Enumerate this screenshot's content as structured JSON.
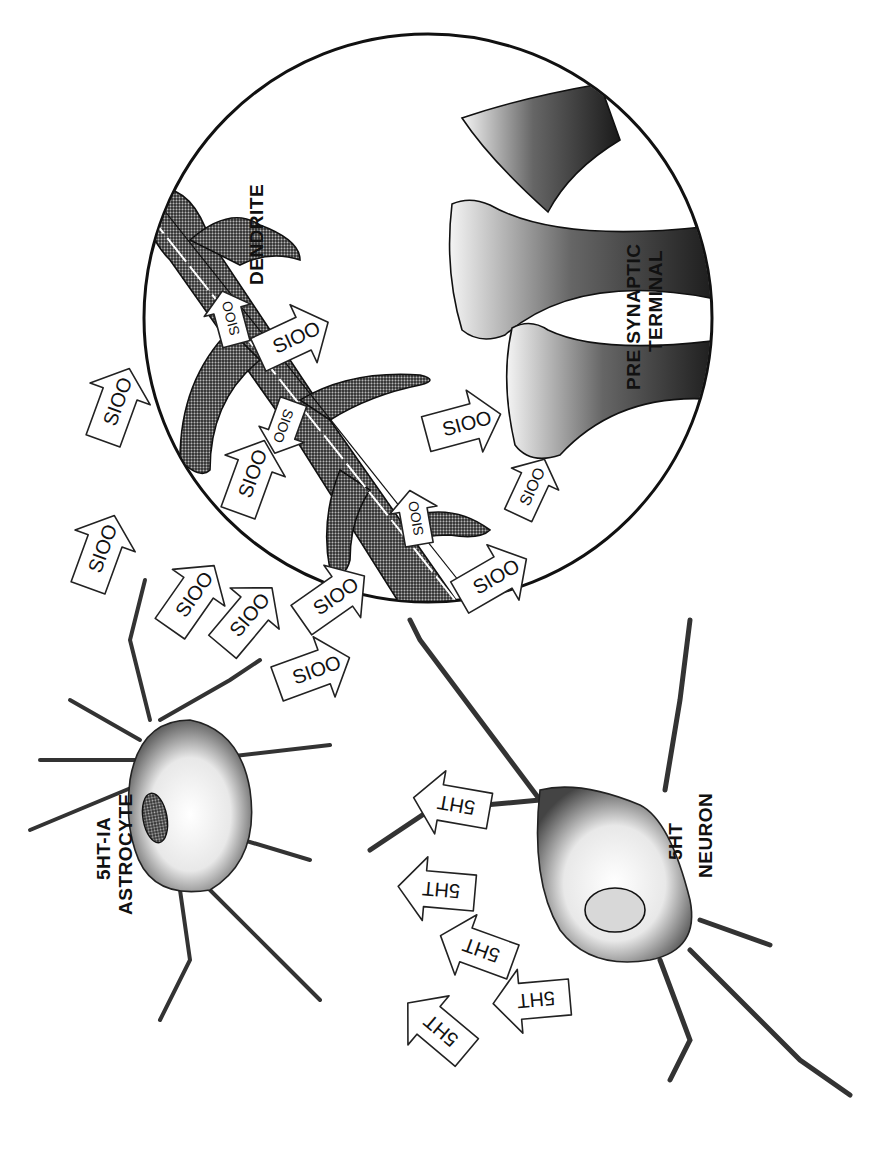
{
  "figure": {
    "orientation": "rotated 90 degrees clockwise",
    "colors": {
      "ink": "#111111",
      "background": "#ffffff"
    }
  },
  "labels": {
    "dendrite": "DENDRITE",
    "presynaptic_line1": "PRE SYNAPTIC",
    "presynaptic_line2": "TERMINAL",
    "astrocyte_line1": "5HT-IA",
    "astrocyte_line2": "ASTROCYTE",
    "neuron_line1": "5HT",
    "neuron_line2": "NEURON"
  },
  "s100_arrows": [
    {
      "text": "SIOO"
    },
    {
      "text": "SIOO"
    },
    {
      "text": "SIOO"
    },
    {
      "text": "SIOO"
    },
    {
      "text": "SIOO"
    },
    {
      "text": "SIOO"
    },
    {
      "text": "SIOO"
    },
    {
      "text": "SIOO"
    },
    {
      "text": "SIOO"
    },
    {
      "text": "SIOO"
    },
    {
      "text": "SIOO"
    },
    {
      "text": "SIOO"
    },
    {
      "text": "SIOO"
    },
    {
      "text": "SIOO"
    }
  ],
  "ht_arrows": [
    {
      "text": "5HT"
    },
    {
      "text": "5HT"
    },
    {
      "text": "5HT"
    },
    {
      "text": "5HT"
    },
    {
      "text": "5HT"
    }
  ],
  "components": {
    "magnified_circle": "Magnified view",
    "astrocyte": "Astrocyte",
    "neuron": "5HT Neuron",
    "presynaptic_terminals": 3
  }
}
